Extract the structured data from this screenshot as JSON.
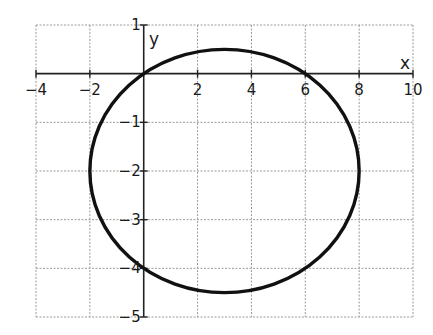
{
  "chart_data": {
    "type": "line",
    "title": "",
    "xlabel": "x",
    "ylabel": "y",
    "xlim": [
      -4,
      10
    ],
    "ylim": [
      -5,
      1
    ],
    "x_ticks": [
      -4,
      -2,
      2,
      4,
      6,
      8,
      10
    ],
    "x_tick_labels": [
      "−4",
      "−2",
      "2",
      "4",
      "6",
      "8",
      "10"
    ],
    "y_ticks": [
      1,
      -1,
      -2,
      -3,
      -4,
      -5
    ],
    "y_tick_labels": [
      "1",
      "−1",
      "−2",
      "−3",
      "−4",
      "−5"
    ],
    "grid": true,
    "grid_style": "dashed",
    "grid_x_step": 2,
    "grid_y_step": 1,
    "series": [
      {
        "name": "ellipse",
        "shape": "ellipse",
        "center": [
          3,
          -2
        ],
        "semi_axis_x": 5,
        "semi_axis_y": 2.5,
        "equation": "(x-3)^2/25 + (y+2)^2/6.25 = 1",
        "key_points": [
          [
            0,
            0
          ],
          [
            6,
            0
          ],
          [
            0,
            -4
          ],
          [
            6,
            -4
          ],
          [
            -2,
            -2
          ],
          [
            8,
            -2
          ],
          [
            3,
            0.5
          ],
          [
            3,
            -4.5
          ]
        ],
        "color": "#111111"
      }
    ],
    "legend": null
  },
  "colors": {
    "curve": "#111111",
    "axis": "#222222",
    "grid": "#9a9a9a",
    "background": "#ffffff"
  }
}
